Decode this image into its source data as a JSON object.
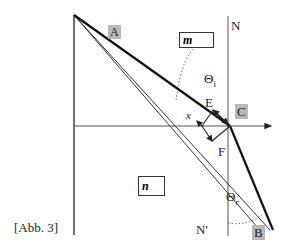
{
  "diagram": {
    "caption": "[Abb. 3]",
    "points": {
      "A": "A",
      "B": "B",
      "C": "C",
      "E": "E",
      "F": "F",
      "X": "x"
    },
    "normals": {
      "top": "N",
      "bottom": "N'"
    },
    "angles": {
      "incidence": "Θ",
      "incidence_sub": "i",
      "reflection": "Θ",
      "reflection_sub": "r"
    },
    "media": {
      "upper": "m",
      "lower": "n"
    },
    "colors": {
      "line": "#222222",
      "point_label_bg": "#b8b8b8"
    }
  }
}
